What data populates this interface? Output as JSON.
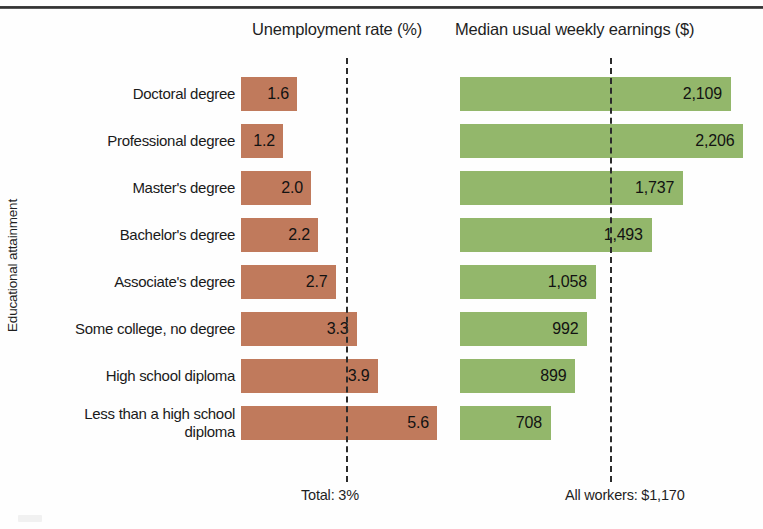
{
  "chart_data": {
    "type": "bar",
    "title": "",
    "orientation": "horizontal",
    "axis_title_y": "Educational attainment",
    "panels": [
      {
        "key": "unemployment",
        "title": "Unemployment rate (%)",
        "color": "#c07a5c",
        "reference_line_value": 3,
        "reference_line_label": "Total: 3%",
        "xlim": [
          0,
          5.6
        ],
        "grid": false
      },
      {
        "key": "earnings",
        "title": "Median usual weekly earnings ($)",
        "color": "#93b76b",
        "reference_line_value": 1170,
        "reference_line_label": "All workers: $1,170",
        "xlim": [
          0,
          2206
        ],
        "grid": false
      }
    ],
    "categories": [
      "Doctoral degree",
      "Professional degree",
      "Master's degree",
      "Bachelor's degree",
      "Associate's degree",
      "Some college, no degree",
      "High school diploma",
      "Less than a high school diploma"
    ],
    "series": [
      {
        "name": "Unemployment rate (%)",
        "values": [
          1.6,
          1.2,
          2.0,
          2.2,
          2.7,
          3.3,
          3.9,
          5.6
        ],
        "labels": [
          "1.6",
          "1.2",
          "2.0",
          "2.2",
          "2.7",
          "3.3",
          "3.9",
          "5.6"
        ]
      },
      {
        "name": "Median usual weekly earnings ($)",
        "values": [
          2109,
          2206,
          1737,
          1493,
          1058,
          992,
          899,
          708
        ],
        "labels": [
          "2,109",
          "2,206",
          "1,737",
          "1,493",
          "1,058",
          "992",
          "899",
          "708"
        ]
      }
    ],
    "legend": null,
    "legend_position": "none"
  },
  "rows": [
    {
      "label": "Doctoral degree",
      "unemp": "1.6",
      "earn": "2,109"
    },
    {
      "label": "Professional degree",
      "unemp": "1.2",
      "earn": "2,206"
    },
    {
      "label": "Master's degree",
      "unemp": "2.0",
      "earn": "1,737"
    },
    {
      "label": "Bachelor's degree",
      "unemp": "2.2",
      "earn": "1,493"
    },
    {
      "label": "Associate's degree",
      "unemp": "2.7",
      "earn": "1,058"
    },
    {
      "label": "Some college, no degree",
      "unemp": "3.3",
      "earn": "992"
    },
    {
      "label": "High school diploma",
      "unemp": "3.9",
      "earn": "899"
    },
    {
      "label": "Less than a high school diploma",
      "unemp": "5.6",
      "earn": "708"
    }
  ],
  "headers": {
    "unemployment": "Unemployment rate (%)",
    "earnings": "Median usual weekly earnings ($)",
    "axis_y": "Educational attainment"
  },
  "footers": {
    "total": "Total: 3%",
    "all_workers": "All workers: $1,170"
  },
  "colors": {
    "orange": "#c07a5c",
    "green": "#93b76b",
    "text": "#1a1a1a",
    "rule": "#2e2e2e"
  }
}
